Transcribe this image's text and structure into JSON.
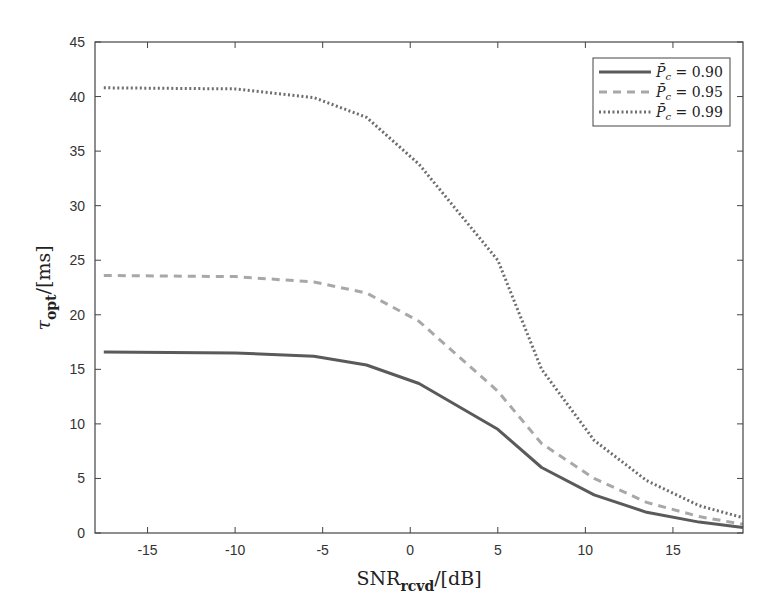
{
  "chart_data": {
    "type": "line",
    "title": "",
    "xlabel": "SNR_rcvd / [dB]",
    "ylabel": "τ_opt / [ms]",
    "xlim": [
      -18,
      19
    ],
    "ylim": [
      0,
      45
    ],
    "xticks": [
      -15,
      -10,
      -5,
      0,
      5,
      10,
      15
    ],
    "yticks": [
      0,
      5,
      10,
      15,
      20,
      25,
      30,
      35,
      40,
      45
    ],
    "grid": false,
    "legend_position": "upper right",
    "x": [
      -17.5,
      -10,
      -5.5,
      -2.5,
      0.5,
      5,
      7.5,
      10.5,
      13.5,
      16.5,
      19
    ],
    "series": [
      {
        "name": "P̄c = 0.90",
        "style": "solid",
        "color": "#5a5a5a",
        "values": [
          16.6,
          16.5,
          16.2,
          15.4,
          13.7,
          9.5,
          6.0,
          3.5,
          1.9,
          1.0,
          0.5
        ]
      },
      {
        "name": "P̄c = 0.95",
        "style": "dashed",
        "color": "#a8a8a8",
        "values": [
          23.6,
          23.5,
          23.0,
          22.0,
          19.4,
          13.0,
          8.2,
          5.0,
          2.8,
          1.5,
          0.8
        ]
      },
      {
        "name": "P̄c = 0.99",
        "style": "dotted",
        "color": "#6e6e6e",
        "values": [
          40.8,
          40.7,
          39.9,
          38.1,
          33.8,
          25.0,
          15.0,
          8.5,
          4.8,
          2.5,
          1.4
        ]
      }
    ]
  },
  "axes": {
    "xlabel_main": "SNR",
    "xlabel_sub": "rcvd",
    "xlabel_unit": "/[dB]",
    "ylabel_main": "τ",
    "ylabel_sub": "opt",
    "ylabel_unit": "/[ms]"
  },
  "legend": {
    "items": [
      {
        "label_pre": "P̄",
        "label_sub": "c",
        "label_val": " = 0.90"
      },
      {
        "label_pre": "P̄",
        "label_sub": "c",
        "label_val": " = 0.95"
      },
      {
        "label_pre": "P̄",
        "label_sub": "c",
        "label_val": " = 0.99"
      }
    ]
  }
}
